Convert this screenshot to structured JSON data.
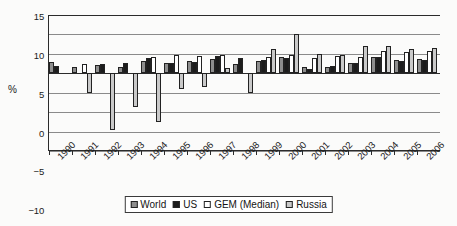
{
  "chart_data": {
    "type": "bar",
    "title": "",
    "xlabel": "",
    "ylabel": "%",
    "ylim": [
      -20,
      15
    ],
    "yticks": [
      15,
      10,
      5,
      0,
      -5,
      -10,
      -15,
      -20
    ],
    "ytick_labels": [
      "15",
      "10",
      "5",
      "0",
      "−5",
      "−10",
      "−15",
      "−20"
    ],
    "grid": true,
    "legend_position": "bottom",
    "categories": [
      "1990",
      "1991",
      "1992",
      "1993",
      "1994",
      "1995",
      "1996",
      "1997",
      "1998",
      "1999",
      "2000",
      "2001",
      "2002",
      "2003",
      "2004",
      "2005",
      "2006"
    ],
    "series": [
      {
        "name": "World",
        "color": "#8e8e8e",
        "values": [
          2.9,
          1.6,
          2.1,
          1.7,
          3.2,
          2.7,
          3.1,
          3.7,
          2.4,
          3.1,
          4.1,
          1.5,
          1.7,
          2.7,
          4.1,
          3.4,
          3.8
        ]
      },
      {
        "name": "US",
        "color": "#1c1c1c",
        "values": [
          1.8,
          0.0,
          2.4,
          2.6,
          4.0,
          2.6,
          3.0,
          4.5,
          3.9,
          3.4,
          4.0,
          1.0,
          1.8,
          2.7,
          4.2,
          3.2,
          3.3
        ]
      },
      {
        "name": "GEM (Median)",
        "color": "#ffffff",
        "values": [
          0.0,
          2.3,
          0.0,
          0.0,
          4.3,
          4.7,
          4.5,
          4.7,
          0.0,
          4.2,
          4.8,
          4.0,
          4.4,
          4.3,
          5.7,
          5.4,
          5.8
        ]
      },
      {
        "name": "Russia",
        "color": "#c9c9c9",
        "values": [
          0.0,
          -5.0,
          -14.6,
          -8.6,
          -12.5,
          -4.0,
          -3.6,
          1.3,
          -5.2,
          6.3,
          10.0,
          5.0,
          4.7,
          7.1,
          7.0,
          6.2,
          6.6
        ]
      }
    ]
  },
  "legend": {
    "items": [
      {
        "label": "World",
        "swatch": "legend-swatch-world"
      },
      {
        "label": "US",
        "swatch": "legend-swatch-us"
      },
      {
        "label": "GEM (Median)",
        "swatch": "legend-swatch-gem"
      },
      {
        "label": "Russia",
        "swatch": "legend-swatch-russia"
      }
    ]
  }
}
